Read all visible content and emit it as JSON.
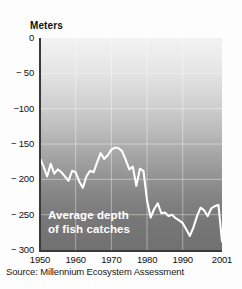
{
  "figure": {
    "axis_title": "Meters",
    "annotation_line1": "Average depth",
    "annotation_line2": "of fish catches",
    "source": "Source: Millennium Ecosystem Assessment"
  },
  "chart_data": {
    "type": "line",
    "title": "",
    "subtitle": "",
    "xlabel": "",
    "ylabel": "Meters",
    "annotation": "Average depth of fish catches",
    "source": "Source: Millennium Ecosystem Assessment",
    "grid": true,
    "legend": "none",
    "line_color": "#ffffff",
    "background_gradient": [
      "#f2f2f2",
      "#717171"
    ],
    "xlim": [
      1950,
      2001
    ],
    "ylim": [
      -300,
      0
    ],
    "xticks": [
      1950,
      1960,
      1970,
      1980,
      1990,
      2001
    ],
    "xtick_labels": [
      "1950",
      "1960",
      "1970",
      "1980",
      "1990",
      "2001"
    ],
    "yticks": [
      0,
      -50,
      -100,
      -150,
      -200,
      -250,
      -300
    ],
    "ytick_labels": [
      "0",
      "− 50",
      "−100",
      "− 150",
      "− 200",
      "− 250",
      "− 300"
    ],
    "series": [
      {
        "name": "Average depth of fish catches",
        "x": [
          1950,
          1951,
          1952,
          1953,
          1954,
          1955,
          1956,
          1957,
          1958,
          1959,
          1960,
          1961,
          1962,
          1963,
          1964,
          1965,
          1966,
          1967,
          1968,
          1969,
          1970,
          1971,
          1972,
          1973,
          1974,
          1975,
          1976,
          1977,
          1978,
          1979,
          1980,
          1981,
          1982,
          1983,
          1984,
          1985,
          1986,
          1987,
          1988,
          1989,
          1990,
          1991,
          1992,
          1993,
          1994,
          1995,
          1996,
          1997,
          1998,
          1999,
          2000,
          2001
        ],
        "values": [
          -170,
          -182,
          -196,
          -178,
          -192,
          -186,
          -190,
          -196,
          -202,
          -188,
          -190,
          -203,
          -212,
          -196,
          -188,
          -190,
          -176,
          -163,
          -171,
          -166,
          -158,
          -155,
          -156,
          -160,
          -172,
          -186,
          -182,
          -209,
          -185,
          -188,
          -230,
          -254,
          -242,
          -234,
          -248,
          -247,
          -252,
          -250,
          -255,
          -258,
          -262,
          -271,
          -280,
          -268,
          -252,
          -240,
          -244,
          -252,
          -241,
          -238,
          -236,
          -288
        ]
      }
    ]
  }
}
